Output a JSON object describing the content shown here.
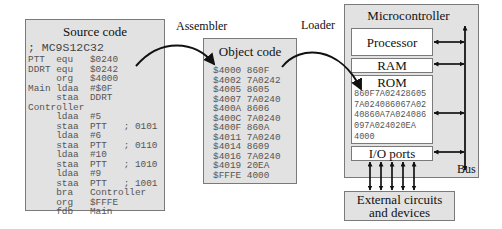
{
  "labels": {
    "assembler": "Assembler",
    "loader": "Loader",
    "bus": "Bus"
  },
  "source": {
    "title": "Source code",
    "lines": [
      "; MC9S12C32",
      "PTT  equ   $0240",
      "DDRT equ   $0242",
      "     org   $4000",
      "Main ldaa  #$0F",
      "     staa  DDRT",
      "Controller",
      "     ldaa  #5",
      "     staa  PTT   ; 0101",
      "     ldaa  #6",
      "     staa  PTT   ; 0110",
      "     ldaa  #10",
      "     staa  PTT   ; 1010",
      "     ldaa  #9",
      "     staa  PTT   ; 1001",
      "     bra   Controller",
      "     org   $FFFE",
      "     fdb   Main"
    ]
  },
  "object": {
    "title": "Object code",
    "lines": [
      "$4000 860F",
      "$4002 7A0242",
      "$4005 8605",
      "$4007 7A0240",
      "$400A 8606",
      "$400C 7A0240",
      "$400F 860A",
      "$4011 7A0240",
      "$4014 8609",
      "$4016 7A0240",
      "$4019 20EA",
      "$FFFE 4000"
    ]
  },
  "microcontroller": {
    "title": "Microcontroller",
    "processor": "Processor",
    "ram": "RAM",
    "rom": {
      "title": "ROM",
      "lines": [
        "860F7A02428605",
        "7A024086067A02",
        "40860A7A024086",
        "097A024020EA",
        "",
        "4000"
      ]
    },
    "io_ports": "I/O ports"
  },
  "external": {
    "line1": "External circuits",
    "line2": "and devices"
  }
}
